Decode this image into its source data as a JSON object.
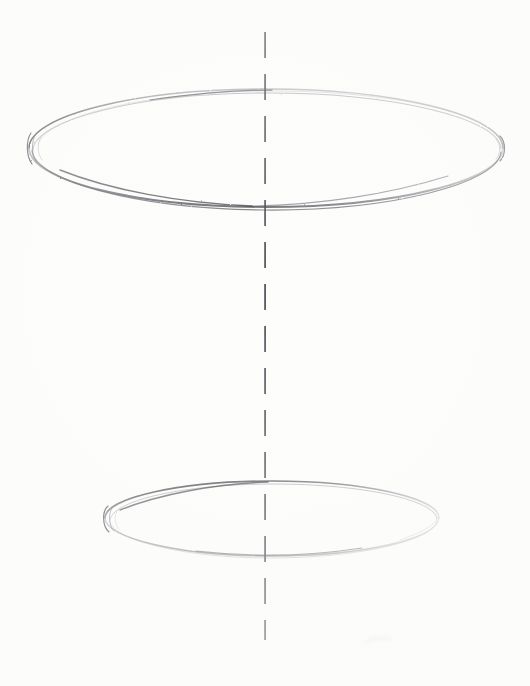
{
  "artwork": {
    "title": "Pencil Sketch — Two Ellipses with Vertical Axis",
    "medium": "graphite pencil on white paper",
    "subject": "cylinder construction guide: two horizontal ellipses sharing a dashed vertical centre axis",
    "canvas": {
      "width": 530,
      "height": 686,
      "background_color": "#fdfdfc"
    },
    "palette": {
      "paper": "#fdfdfc",
      "graphite_dark": "#2b2b30",
      "graphite_mid": "#5a5a63",
      "graphite_light": "#9a9aa2",
      "graphite_faint": "#c9c9cf",
      "axis_line": "#4a4a52"
    },
    "elements": [
      {
        "name": "top-ellipse",
        "shape": "ellipse",
        "center_x": 266,
        "center_y": 148,
        "radius_x": 237,
        "radius_y": 59,
        "stroke_passes": 3,
        "darkest_arc": "lower-left",
        "lightest_arc": "upper-right",
        "note": "wide open ellipse, multiple overlapping construction passes, doubled contour at left tip"
      },
      {
        "name": "bottom-ellipse",
        "shape": "ellipse",
        "center_x": 272,
        "center_y": 518,
        "radius_x": 167,
        "radius_y": 37,
        "stroke_passes": 2,
        "darkest_arc": "upper-left",
        "lightest_arc": "lower-right",
        "note": "narrower and flatter ellipse, doubled contour at left tip"
      },
      {
        "name": "vertical-axis",
        "shape": "dashed-line",
        "x": 265,
        "y_start": 32,
        "y_end": 640,
        "dash_length": 26,
        "gap_length": 16,
        "stroke_width": 1.6,
        "note": "dashed centre axis running through both ellipse centres"
      },
      {
        "name": "eraser-smudge",
        "shape": "smudge",
        "center_x": 377,
        "center_y": 640,
        "note": "very faint residual graphite mark near lower right"
      }
    ]
  }
}
